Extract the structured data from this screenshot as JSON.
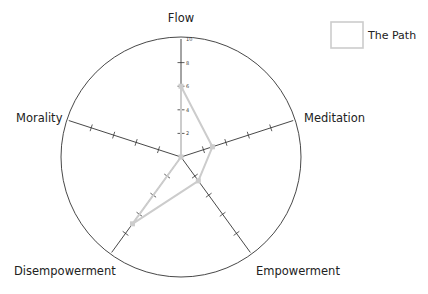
{
  "chart_data": {
    "type": "radar",
    "title": "",
    "axes": [
      "Flow",
      "Meditation",
      "Empowerment",
      "Disempowerment",
      "Morality"
    ],
    "range": [
      0,
      10
    ],
    "ticks": [
      2,
      4,
      6,
      8,
      10
    ],
    "tick_labels": [
      "2",
      "4",
      "6",
      "8",
      "10"
    ],
    "grid": false,
    "legend_position": "top-right",
    "series": [
      {
        "name": "The Path",
        "values": [
          6,
          2.8,
          2.5,
          7,
          0
        ],
        "color": "#cccccc"
      }
    ]
  },
  "colors": {
    "axis": "#333333",
    "circle": "#333333",
    "series": "#cccccc",
    "legend_box": "#cccccc"
  }
}
